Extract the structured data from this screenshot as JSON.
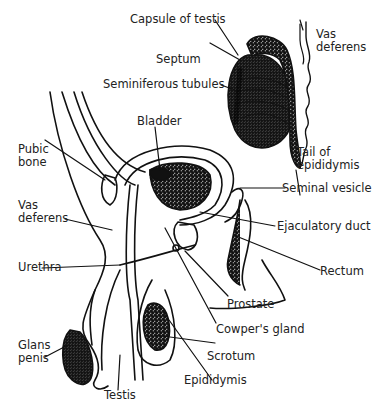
{
  "diagram": {
    "labels": {
      "capsule_of_testis": "Capsule of testis",
      "vas_deferens_top_1": "Vas",
      "vas_deferens_top_2": "deferens",
      "septum": "Septum",
      "seminiferous_tubules": "Seminiferous tubules",
      "tail_of_epididymis_1": "Tail of",
      "tail_of_epididymis_2": "epididymis",
      "bladder": "Bladder",
      "pubic_bone_1": "Pubic",
      "pubic_bone_2": "bone",
      "seminal_vesicle": "Seminal vesicle",
      "vas_deferens_1": "Vas",
      "vas_deferens_2": "deferens",
      "ejaculatory_duct": "Ejaculatory duct",
      "urethra": "Urethra",
      "rectum": "Rectum",
      "prostate": "Prostate",
      "cowpers_gland": "Cowper's gland",
      "glans_penis_1": "Glans",
      "glans_penis_2": "penis",
      "scrotum": "Scrotum",
      "epididymis": "Epididymis",
      "testis": "Testis"
    }
  }
}
